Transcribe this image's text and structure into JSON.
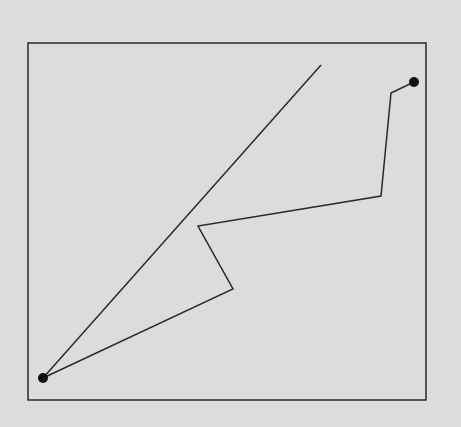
{
  "canvas": {
    "width": 461,
    "height": 427,
    "background": "#dcdcdc",
    "stroke": "#2a2a2a"
  },
  "frame": {
    "x": 28,
    "y": 43,
    "width": 398,
    "height": 357
  },
  "straight_line": {
    "x1": 43,
    "y1": 378,
    "x2": 321,
    "y2": 65
  },
  "path": {
    "points": [
      [
        43,
        378
      ],
      [
        233,
        289
      ],
      [
        198,
        226
      ],
      [
        381,
        196
      ],
      [
        391,
        93
      ],
      [
        414,
        82
      ]
    ]
  },
  "start_point": {
    "x": 43,
    "y": 378,
    "r": 5
  },
  "end_point": {
    "x": 414,
    "y": 82,
    "r": 5
  }
}
